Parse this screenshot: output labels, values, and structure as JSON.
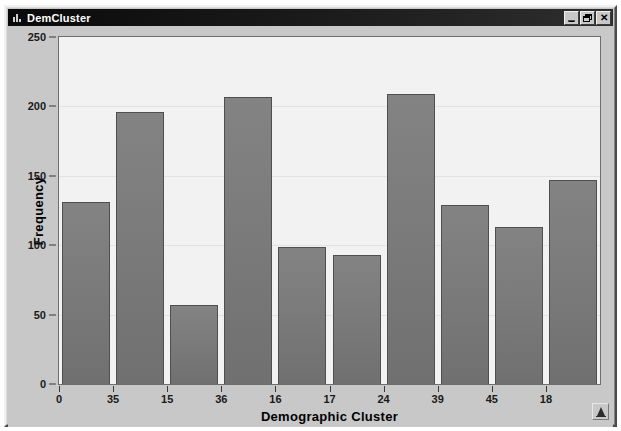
{
  "window": {
    "title": "DemCluster",
    "icon": "bar-chart-icon",
    "controls": {
      "minimize_label": "Minimize",
      "restore_label": "Restore",
      "close_label": "✕"
    }
  },
  "status": {
    "icon": "alert-triangle-icon"
  },
  "colors": {
    "titlebar": "#0a0a0a",
    "window_face": "#c8c8c8",
    "plot_background": "#f2f2f2",
    "bar_fill": "#7b7b7b",
    "bar_border": "#4f4f4f",
    "gridline": "#e2e2e2",
    "axis": "#3a3a3a",
    "text": "#000000"
  },
  "chart_data": {
    "type": "bar",
    "title": "",
    "xlabel": "Demographic Cluster",
    "ylabel": "Frequency",
    "categories": [
      "0",
      "35",
      "15",
      "36",
      "16",
      "17",
      "24",
      "39",
      "45",
      "18"
    ],
    "values": [
      131,
      196,
      57,
      207,
      99,
      93,
      209,
      129,
      113,
      147
    ],
    "ylim": [
      0,
      250
    ],
    "yticks": [
      0,
      50,
      100,
      150,
      200,
      250
    ],
    "ytick_labels": [
      "0",
      "50",
      "100",
      "150",
      "200",
      "250"
    ],
    "grid": true,
    "grid_axis": "y",
    "legend": false,
    "legend_position": "none",
    "orientation": "vertical"
  }
}
